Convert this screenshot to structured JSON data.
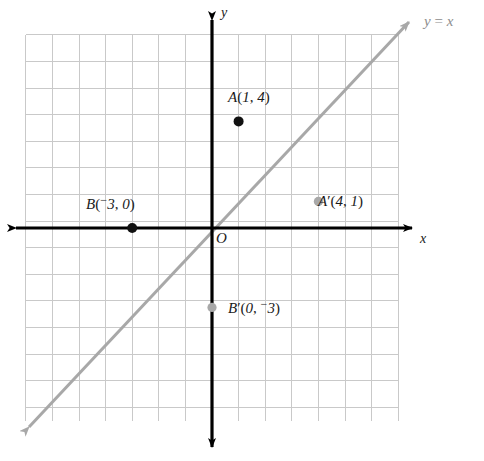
{
  "figure": {
    "kind": "coordinate-plane-reflection-diagram",
    "width": 484,
    "height": 461
  },
  "axes": {
    "x_label": "x",
    "y_label": "y",
    "origin_label": "O",
    "color": "#000000"
  },
  "line": {
    "equation_label_full": "y = x",
    "equation_parts": {
      "lhs": "y",
      "operator": "=",
      "rhs": "x"
    },
    "color": "#a8a8a8"
  },
  "grid": {
    "color": "#c9c9c9",
    "cell_size_px": 26.6,
    "x_min": -7,
    "x_max": 7,
    "y_min": -7,
    "y_max": 7
  },
  "points": [
    {
      "id": "A",
      "name": "A",
      "prime": false,
      "x": 1,
      "y": 4,
      "x_text": "1",
      "y_text": "4",
      "x_negative": false,
      "y_negative": false,
      "label_full": "A(1, 4)",
      "color": "#111111",
      "style": "solid-black"
    },
    {
      "id": "B",
      "name": "B",
      "prime": false,
      "x": -3,
      "y": 0,
      "x_text": "3",
      "y_text": "0",
      "x_negative": true,
      "y_negative": false,
      "label_full": "B(⁻3, 0)",
      "color": "#111111",
      "style": "solid-black"
    },
    {
      "id": "A-prime",
      "name": "A",
      "prime": true,
      "x": 4,
      "y": 1,
      "x_text": "4",
      "y_text": "1",
      "x_negative": false,
      "y_negative": false,
      "label_full": "A′(4, 1)",
      "color": "#a8a8a8",
      "style": "solid-gray"
    },
    {
      "id": "B-prime",
      "name": "B",
      "prime": true,
      "x": 0,
      "y": -3,
      "x_text": "0",
      "y_text": "3",
      "x_negative": false,
      "y_negative": true,
      "label_full": "B′(0, ⁻3)",
      "color": "#a8a8a8",
      "style": "solid-gray"
    }
  ],
  "chart_data": {
    "type": "scatter",
    "title": "",
    "xlabel": "x",
    "ylabel": "y",
    "xlim": [
      -7,
      7
    ],
    "ylim": [
      -7,
      7
    ],
    "grid": true,
    "legend": "none",
    "annotations": [
      "A(1, 4)",
      "B(⁻3, 0)",
      "A′(4, 1)",
      "B′(0, ⁻3)",
      "y = x",
      "O"
    ],
    "lines": [
      {
        "name": "y = x",
        "slope": 1,
        "intercept": 0,
        "color": "#a8a8a8",
        "arrows": "both"
      }
    ],
    "series": [
      {
        "name": "preimage",
        "color": "#111111",
        "points": [
          {
            "label": "A",
            "x": 1,
            "y": 4
          },
          {
            "label": "B",
            "x": -3,
            "y": 0
          }
        ]
      },
      {
        "name": "image",
        "color": "#a8a8a8",
        "points": [
          {
            "label": "A′",
            "x": 4,
            "y": 1
          },
          {
            "label": "B′",
            "x": 0,
            "y": -3
          }
        ]
      }
    ]
  }
}
